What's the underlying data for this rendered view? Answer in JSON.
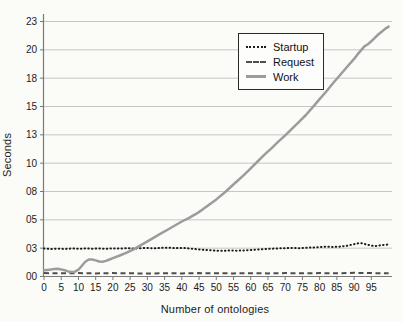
{
  "figure": {
    "ylabel": "Seconds",
    "xlabel": "Number of ontologies"
  },
  "legend": {
    "position": "top-right",
    "items": [
      {
        "label": "Startup",
        "style": "dotted",
        "color": "#1c1c1c"
      },
      {
        "label": "Request",
        "style": "dashed",
        "color": "#4d4d4d"
      },
      {
        "label": "Work",
        "style": "solid",
        "color": "#9c9c9c"
      }
    ]
  },
  "chart_data": {
    "type": "line",
    "title": "",
    "xlabel": "Number of ontologies",
    "ylabel": "Seconds",
    "xlim": [
      0,
      101
    ],
    "ylim": [
      0,
      22.5
    ],
    "grid": "horizontal",
    "x_ticks": [
      0,
      5,
      10,
      15,
      20,
      25,
      30,
      35,
      40,
      45,
      50,
      55,
      60,
      65,
      70,
      75,
      80,
      85,
      90,
      95
    ],
    "y_ticks": [
      {
        "value": 0,
        "label": "00"
      },
      {
        "value": 2.5,
        "label": "03"
      },
      {
        "value": 5,
        "label": "05"
      },
      {
        "value": 7.5,
        "label": "08"
      },
      {
        "value": 10,
        "label": "10"
      },
      {
        "value": 12.5,
        "label": "13"
      },
      {
        "value": 15,
        "label": "15"
      },
      {
        "value": 17.5,
        "label": "18"
      },
      {
        "value": 20,
        "label": "20"
      },
      {
        "value": 22.5,
        "label": "23"
      }
    ],
    "series": [
      {
        "name": "Startup",
        "style": "dotted",
        "color": "#1c1c1c",
        "width": 2,
        "points": [
          [
            0,
            2.48
          ],
          [
            2,
            2.42
          ],
          [
            4,
            2.46
          ],
          [
            6,
            2.43
          ],
          [
            8,
            2.47
          ],
          [
            10,
            2.44
          ],
          [
            12,
            2.48
          ],
          [
            14,
            2.45
          ],
          [
            16,
            2.47
          ],
          [
            18,
            2.44
          ],
          [
            20,
            2.48
          ],
          [
            22,
            2.46
          ],
          [
            24,
            2.5
          ],
          [
            26,
            2.47
          ],
          [
            28,
            2.5
          ],
          [
            30,
            2.52
          ],
          [
            32,
            2.48
          ],
          [
            34,
            2.52
          ],
          [
            36,
            2.55
          ],
          [
            38,
            2.5
          ],
          [
            40,
            2.52
          ],
          [
            42,
            2.48
          ],
          [
            44,
            2.42
          ],
          [
            46,
            2.36
          ],
          [
            48,
            2.32
          ],
          [
            50,
            2.28
          ],
          [
            52,
            2.26
          ],
          [
            54,
            2.3
          ],
          [
            56,
            2.28
          ],
          [
            58,
            2.3
          ],
          [
            60,
            2.34
          ],
          [
            62,
            2.38
          ],
          [
            64,
            2.42
          ],
          [
            66,
            2.45
          ],
          [
            68,
            2.48
          ],
          [
            70,
            2.5
          ],
          [
            72,
            2.52
          ],
          [
            74,
            2.5
          ],
          [
            76,
            2.54
          ],
          [
            78,
            2.56
          ],
          [
            80,
            2.6
          ],
          [
            82,
            2.64
          ],
          [
            84,
            2.6
          ],
          [
            86,
            2.64
          ],
          [
            88,
            2.72
          ],
          [
            90,
            2.85
          ],
          [
            91,
            2.92
          ],
          [
            92,
            2.95
          ],
          [
            93,
            2.88
          ],
          [
            94,
            2.8
          ],
          [
            95,
            2.72
          ],
          [
            96,
            2.68
          ],
          [
            97,
            2.72
          ],
          [
            98,
            2.78
          ],
          [
            99,
            2.8
          ],
          [
            100,
            2.82
          ]
        ]
      },
      {
        "name": "Request",
        "style": "dashed",
        "color": "#4d4d4d",
        "width": 2,
        "points": [
          [
            0,
            0.3
          ],
          [
            5,
            0.28
          ],
          [
            10,
            0.3
          ],
          [
            15,
            0.27
          ],
          [
            20,
            0.3
          ],
          [
            25,
            0.28
          ],
          [
            30,
            0.26
          ],
          [
            35,
            0.29
          ],
          [
            40,
            0.27
          ],
          [
            45,
            0.3
          ],
          [
            50,
            0.28
          ],
          [
            55,
            0.27
          ],
          [
            60,
            0.29
          ],
          [
            65,
            0.27
          ],
          [
            70,
            0.3
          ],
          [
            75,
            0.28
          ],
          [
            80,
            0.3
          ],
          [
            85,
            0.28
          ],
          [
            90,
            0.33
          ],
          [
            95,
            0.3
          ],
          [
            100,
            0.28
          ]
        ]
      },
      {
        "name": "Work",
        "style": "solid",
        "color": "#9c9c9c",
        "width": 2.5,
        "points": [
          [
            0,
            0.55
          ],
          [
            1,
            0.58
          ],
          [
            2,
            0.62
          ],
          [
            3,
            0.66
          ],
          [
            4,
            0.68
          ],
          [
            5,
            0.63
          ],
          [
            6,
            0.55
          ],
          [
            7,
            0.45
          ],
          [
            8,
            0.4
          ],
          [
            9,
            0.42
          ],
          [
            10,
            0.6
          ],
          [
            11,
            0.95
          ],
          [
            12,
            1.3
          ],
          [
            13,
            1.5
          ],
          [
            14,
            1.5
          ],
          [
            15,
            1.42
          ],
          [
            16,
            1.32
          ],
          [
            17,
            1.3
          ],
          [
            18,
            1.38
          ],
          [
            19,
            1.5
          ],
          [
            20,
            1.62
          ],
          [
            22,
            1.85
          ],
          [
            24,
            2.1
          ],
          [
            26,
            2.4
          ],
          [
            28,
            2.75
          ],
          [
            30,
            3.1
          ],
          [
            32,
            3.45
          ],
          [
            34,
            3.8
          ],
          [
            36,
            4.15
          ],
          [
            38,
            4.5
          ],
          [
            40,
            4.85
          ],
          [
            42,
            5.15
          ],
          [
            44,
            5.5
          ],
          [
            46,
            5.9
          ],
          [
            48,
            6.35
          ],
          [
            50,
            6.8
          ],
          [
            52,
            7.3
          ],
          [
            54,
            7.85
          ],
          [
            56,
            8.4
          ],
          [
            58,
            8.95
          ],
          [
            60,
            9.55
          ],
          [
            62,
            10.15
          ],
          [
            64,
            10.75
          ],
          [
            66,
            11.3
          ],
          [
            68,
            11.9
          ],
          [
            70,
            12.45
          ],
          [
            72,
            13.05
          ],
          [
            74,
            13.65
          ],
          [
            76,
            14.25
          ],
          [
            78,
            14.95
          ],
          [
            80,
            15.65
          ],
          [
            82,
            16.35
          ],
          [
            84,
            17.1
          ],
          [
            86,
            17.8
          ],
          [
            88,
            18.5
          ],
          [
            90,
            19.2
          ],
          [
            91,
            19.6
          ],
          [
            92,
            19.95
          ],
          [
            93,
            20.3
          ],
          [
            94,
            20.5
          ],
          [
            95,
            20.75
          ],
          [
            96,
            21.05
          ],
          [
            97,
            21.35
          ],
          [
            98,
            21.6
          ],
          [
            99,
            21.85
          ],
          [
            100,
            22.05
          ]
        ]
      }
    ]
  }
}
